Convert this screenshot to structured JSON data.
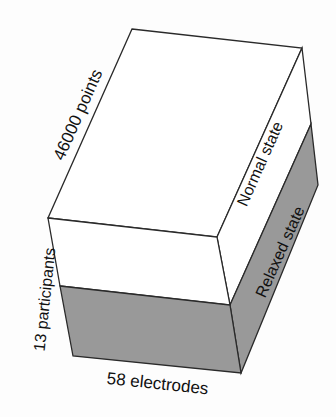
{
  "diagram": {
    "type": "3d-data-cube",
    "labels": {
      "depth_axis": "46000 points",
      "height_axis": "13 participants",
      "width_axis": "58 electrodes",
      "upper_slice": "Normal state",
      "lower_slice": "Relaxed state"
    },
    "colors": {
      "background": "#fdfdfd",
      "normal_state_fill": "#ffffff",
      "relaxed_state_fill": "#999999",
      "edge": "#2a2a2a"
    }
  }
}
